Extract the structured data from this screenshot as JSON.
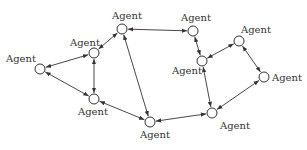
{
  "diagram": {
    "type": "network",
    "node_label": "Agent",
    "colors": {
      "stroke": "#333333",
      "background": "#ffffff"
    },
    "nodes": [
      {
        "id": "a1",
        "label": "Agent",
        "x": 40,
        "y": 69,
        "label_x": 6,
        "label_y": 62
      },
      {
        "id": "a2",
        "label": "Agent",
        "x": 94,
        "y": 53,
        "label_x": 70,
        "label_y": 46
      },
      {
        "id": "a3",
        "label": "Agent",
        "x": 122,
        "y": 29,
        "label_x": 112,
        "label_y": 19
      },
      {
        "id": "a4",
        "label": "Agent",
        "x": 94,
        "y": 99,
        "label_x": 78,
        "label_y": 115
      },
      {
        "id": "a5",
        "label": "Agent",
        "x": 150,
        "y": 122,
        "label_x": 140,
        "label_y": 138
      },
      {
        "id": "a6",
        "label": "Agent",
        "x": 193,
        "y": 31,
        "label_x": 181,
        "label_y": 21
      },
      {
        "id": "a7",
        "label": "Agent",
        "x": 202,
        "y": 61,
        "label_x": 172,
        "label_y": 74
      },
      {
        "id": "a8",
        "label": "Agent",
        "x": 239,
        "y": 41,
        "label_x": 241,
        "label_y": 33
      },
      {
        "id": "a9",
        "label": "Agent",
        "x": 264,
        "y": 77,
        "label_x": 272,
        "label_y": 81
      },
      {
        "id": "a10",
        "label": "Agent",
        "x": 212,
        "y": 113,
        "label_x": 220,
        "label_y": 129
      }
    ],
    "edges": [
      {
        "from": "a1",
        "to": "a2"
      },
      {
        "from": "a1",
        "to": "a4"
      },
      {
        "from": "a2",
        "to": "a3"
      },
      {
        "from": "a2",
        "to": "a4"
      },
      {
        "from": "a3",
        "to": "a6"
      },
      {
        "from": "a3",
        "to": "a5"
      },
      {
        "from": "a4",
        "to": "a5"
      },
      {
        "from": "a5",
        "to": "a10"
      },
      {
        "from": "a6",
        "to": "a7"
      },
      {
        "from": "a7",
        "to": "a8"
      },
      {
        "from": "a7",
        "to": "a10"
      },
      {
        "from": "a8",
        "to": "a9"
      },
      {
        "from": "a9",
        "to": "a10"
      }
    ]
  }
}
